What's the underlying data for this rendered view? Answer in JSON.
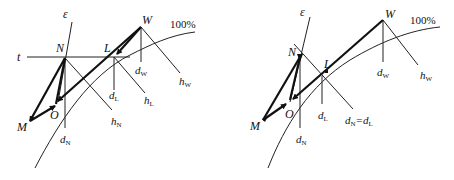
{
  "figure": {
    "left_panel": {
      "points": {
        "M": "M",
        "N": "N",
        "O": "O",
        "L": "L",
        "W": "W"
      },
      "lines": {
        "epsilon": "ε",
        "t": "t"
      },
      "curve_label": "100%",
      "directions": {
        "dN": {
          "base": "d",
          "sub": "N"
        },
        "hN": {
          "base": "h",
          "sub": "N"
        },
        "dL": {
          "base": "d",
          "sub": "L"
        },
        "hL": {
          "base": "h",
          "sub": "L"
        },
        "dW": {
          "base": "d",
          "sub": "W"
        },
        "hW": {
          "base": "h",
          "sub": "W"
        }
      }
    },
    "right_panel": {
      "points": {
        "M": "M",
        "N": "N",
        "O": "O",
        "L": "L",
        "W": "W"
      },
      "lines": {
        "epsilon": "ε"
      },
      "curve_label": "100%",
      "directions": {
        "dN": {
          "base": "d",
          "sub": "N"
        },
        "dL": {
          "base": "d",
          "sub": "L"
        },
        "hNeqdL": {
          "base1": "d",
          "sub1": "N",
          "eq": "=",
          "base2": "d",
          "sub2": "L"
        },
        "dW": {
          "base": "d",
          "sub": "W"
        },
        "hW": {
          "base": "h",
          "sub": "W"
        }
      }
    }
  }
}
